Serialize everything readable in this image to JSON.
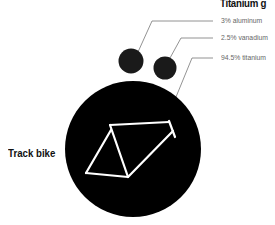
{
  "title": "Titanium g",
  "composition": [
    {
      "label": "3% aluminum",
      "value": 3
    },
    {
      "label": "2.5% vanadium",
      "value": 2.5
    },
    {
      "label": "94.5% titanium",
      "value": 94.5
    }
  ],
  "bike": {
    "label": "Track bike",
    "icon": "bike-frame-icon"
  },
  "colors": {
    "circle": "#000000",
    "small_circle": "#1a1a1a",
    "leader": "#777777",
    "frame": "#ffffff"
  }
}
